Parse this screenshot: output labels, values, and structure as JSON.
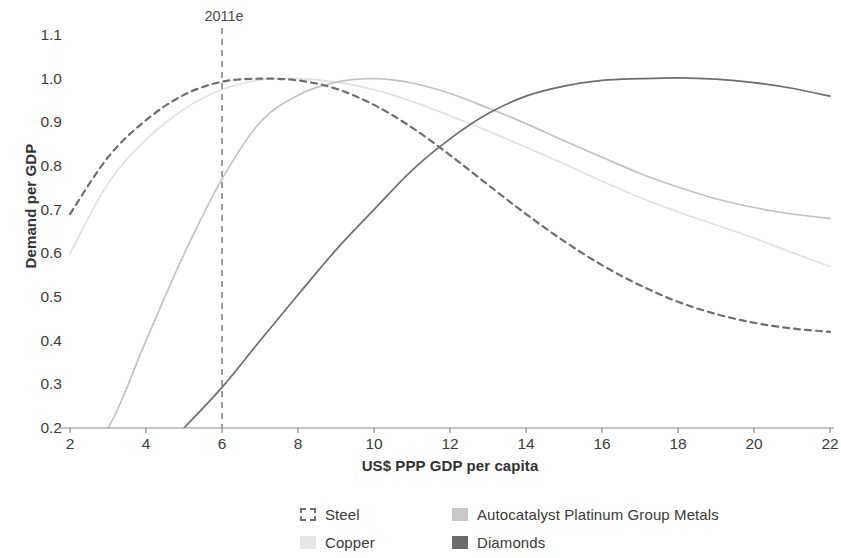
{
  "chart_data": {
    "type": "line",
    "title": "",
    "xlabel": "US$ PPP GDP per capita",
    "ylabel": "Demand per GDP",
    "xlim": [
      2,
      22
    ],
    "ylim": [
      0.2,
      1.1
    ],
    "xticks": [
      "2",
      "4",
      "6",
      "8",
      "10",
      "12",
      "14",
      "16",
      "18",
      "20",
      "22"
    ],
    "yticks": [
      "1.1",
      "1.0",
      "0.9",
      "0.8",
      "0.7",
      "0.6",
      "0.5",
      "0.4",
      "0.3",
      "0.2"
    ],
    "grid": false,
    "legend_position": "bottom",
    "annotations": [
      {
        "text": "2011e",
        "x": 6,
        "type": "vertical-dashed-line",
        "color": "#7b7f8a"
      }
    ],
    "x": [
      2,
      3,
      4,
      5,
      6,
      7,
      8,
      9,
      10,
      11,
      12,
      13,
      14,
      15,
      16,
      17,
      18,
      19,
      20,
      21,
      22
    ],
    "series": [
      {
        "name": "Steel",
        "color": "#6e6e6e",
        "style": "dashed",
        "values": [
          0.69,
          0.82,
          0.905,
          0.963,
          0.993,
          1.0,
          0.996,
          0.977,
          0.94,
          0.888,
          0.825,
          0.757,
          0.69,
          0.628,
          0.573,
          0.527,
          0.489,
          0.461,
          0.441,
          0.428,
          0.42
        ]
      },
      {
        "name": "Copper",
        "color": "#e2e2e2",
        "style": "solid",
        "values": [
          0.6,
          0.76,
          0.86,
          0.93,
          0.975,
          0.997,
          1.0,
          0.992,
          0.975,
          0.948,
          0.915,
          0.88,
          0.843,
          0.805,
          0.765,
          0.728,
          0.695,
          0.665,
          0.635,
          0.602,
          0.57
        ]
      },
      {
        "name": "Autocatalyst Platinum Group Metals",
        "color": "#c2c2c2",
        "style": "solid",
        "values": [
          0.12,
          0.2,
          0.4,
          0.598,
          0.77,
          0.9,
          0.962,
          0.992,
          1.0,
          0.99,
          0.966,
          0.933,
          0.897,
          0.858,
          0.82,
          0.783,
          0.752,
          0.725,
          0.705,
          0.69,
          0.68
        ]
      },
      {
        "name": "Diamonds",
        "color": "#6e6e6e",
        "style": "solid",
        "values": [
          0.012,
          0.06,
          0.11,
          0.2,
          0.293,
          0.4,
          0.505,
          0.608,
          0.7,
          0.79,
          0.862,
          0.92,
          0.96,
          0.983,
          0.996,
          1.0,
          1.002,
          0.999,
          0.991,
          0.978,
          0.96
        ]
      }
    ]
  },
  "axes": {
    "y_title": "Demand per GDP",
    "x_title": "US$ PPP GDP per capita"
  },
  "marker": {
    "label": "2011e"
  },
  "legend": {
    "items": [
      {
        "label": "Steel",
        "swatch": "dashed-box",
        "color": "#6e6e6e"
      },
      {
        "label": "Autocatalyst Platinum Group Metals",
        "swatch": "filled-box",
        "color": "#c9c9c9"
      },
      {
        "label": "Copper",
        "swatch": "filled-box",
        "color": "#e6e6e6"
      },
      {
        "label": "Diamonds",
        "swatch": "filled-box",
        "color": "#6b6b6b"
      }
    ]
  }
}
